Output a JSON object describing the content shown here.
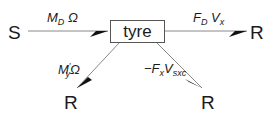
{
  "diagram": {
    "center_node": "tyre",
    "source_node": "S",
    "sink_nodes": [
      "R",
      "R",
      "R"
    ],
    "edges": [
      {
        "from": "S",
        "to": "tyre",
        "label_main": "M",
        "label_sub": "D",
        "label_tail": "Ω"
      },
      {
        "from": "tyre",
        "to": "R",
        "label_main": "F",
        "label_sub": "D",
        "label_tail": "V",
        "label_tail_sub": "x"
      },
      {
        "from": "tyre",
        "to": "R",
        "label_main": "M",
        "label_sup": "′",
        "label_sub": "y",
        "label_tail": "Ω"
      },
      {
        "from": "tyre",
        "to": "R",
        "label_main": "−F",
        "label_sub": "x",
        "label_tail": "V",
        "label_tail_sub": "sxc"
      }
    ],
    "colors": {
      "line": "#777777",
      "arrow": "#111111",
      "text": "#1a1a1a"
    }
  }
}
